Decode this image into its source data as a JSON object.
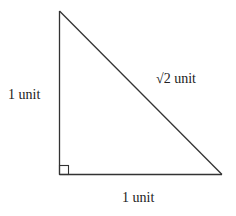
{
  "diagram": {
    "type": "right-triangle",
    "labels": {
      "left_leg": "1 unit",
      "hypotenuse": "√2 unit",
      "bottom_leg": "1 unit"
    },
    "right_angle_marker": true,
    "colors": {
      "stroke": "#333333",
      "background": "#ffffff"
    }
  }
}
